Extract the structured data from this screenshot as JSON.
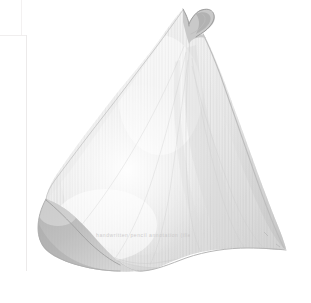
{
  "artwork": {
    "title": "Pale curled leaf specimen",
    "subject": "leaf",
    "medium": "graphite and pale wash on paper",
    "orientation": "portrait",
    "inscription": "handwritten pencil annotation (illegible)",
    "background_color": "#ffffff",
    "palette": {
      "paper": "#ffffff",
      "highlight": "#fbfbfb",
      "light_wash": "#f2f2f2",
      "mid_wash": "#e2e2e2",
      "shadow": "#cfcfcf",
      "deep_shadow": "#a8a8a8",
      "outline": "#b9b9b9",
      "edge_line": "#eceaea"
    }
  },
  "canvas": {
    "width": 311,
    "height": 303
  },
  "paper_marks": {
    "vertical_edge_label": "scan paper edge",
    "horizontal_edge_label": "scan paper edge"
  }
}
